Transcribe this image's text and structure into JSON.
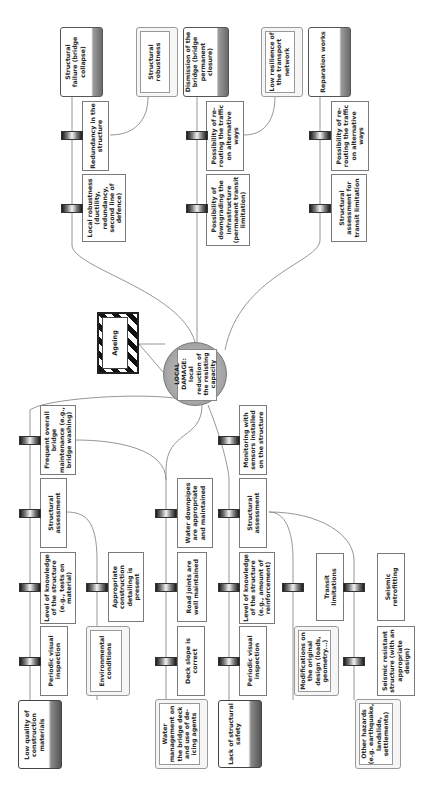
{
  "diagram": {
    "type": "bow-tie",
    "orientation": "rotated 90 degrees counter-clockwise",
    "hazard": {
      "label": "Ageing"
    },
    "top_event": {
      "label": "LOCAL DAMAGE: local reduction of the resisting capacity"
    },
    "threats": [
      {
        "id": "t1",
        "label": "Low quality of construction materials"
      },
      {
        "id": "t2",
        "label": "Water management on the bridge deck and use of de-icing agents"
      },
      {
        "id": "t3",
        "label": "Lack of structural safety"
      },
      {
        "id": "t4",
        "label": "Other hazards (e.g. earthquake, landslide, settlements)"
      }
    ],
    "escalation_factors": [
      {
        "id": "e1",
        "label": "Environmental conditions"
      },
      {
        "id": "e2",
        "label": "Modifications on the original design (loads, geometry...)"
      },
      {
        "id": "e3",
        "label": "Structural robustness"
      },
      {
        "id": "e4",
        "label": "Low resilience of the transport network"
      }
    ],
    "consequences": [
      {
        "id": "c1",
        "label": "Structural failure (bridge collapse)"
      },
      {
        "id": "c2",
        "label": "Dismission of the bridge (bridge permanent closure)"
      },
      {
        "id": "c3",
        "label": "Reparation works"
      }
    ],
    "barriers": {
      "b1": "Periodic visual inspection",
      "b2": "Level of knowledge of the structure (e.g., tests on material)",
      "b3": "Structural assessment",
      "b4": "Frequent overall bridge maintenance (e.g., bridge washing)",
      "b5": "Appropriate construction detailing is present",
      "b6": "Deck slope is correct",
      "b7": "Road joints are well maintained",
      "b8": "Water downpipes are appropriate and maintained",
      "b9": "Periodic visual inspection",
      "b10": "Level of knowledge of the structure (e.g., amount of reinforcement)",
      "b11": "Structural assessment",
      "b12": "Monitoring with sensors installed on the structure",
      "b13": "Transit limitations",
      "b14": "Seismic retrofitting",
      "b15": "Seismic resistant structure (with an appropriate design)",
      "b16": "Local robustness (ductility, redundancy, second line of defence)",
      "b17": "Redundancy in the structure",
      "b18": "Possibility of downgrading the infrastructure (permanent transit limitation)",
      "b19": "Possibility of re-routing the traffic on alternative ways",
      "b20": "Structural assessment for transit limitation",
      "b21": "Possibility of re-routing the traffic on alternative ways"
    }
  },
  "colors": {
    "line": "#8a8a8a",
    "border": "#7a7a7a",
    "consequence_shade": "#6c6c6c",
    "threat_shade": "#555555",
    "event_fill": "#a9a9a9"
  }
}
